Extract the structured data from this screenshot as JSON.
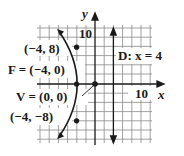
{
  "figure": {
    "type": "parabola-graph",
    "equation_hint": "y^2 = -16x",
    "axes": {
      "x_label": "x",
      "y_label": "y",
      "x_tick_label": "10",
      "y_tick_label": "10",
      "grid_step": 2,
      "x_range": [
        -12,
        12
      ],
      "y_range": [
        -12,
        12
      ]
    },
    "labels": {
      "point_top": "(−4, 8)",
      "focus": "F = (−4, 0)",
      "vertex": "V = (0, 0)",
      "point_bottom": "(−4, −8)",
      "directrix": "D: x = 4"
    },
    "points": [
      {
        "name": "point_top",
        "x": -4,
        "y": 8
      },
      {
        "name": "focus",
        "x": -4,
        "y": 0
      },
      {
        "name": "vertex",
        "x": 0,
        "y": 0
      },
      {
        "name": "point_bottom",
        "x": -4,
        "y": -8
      }
    ],
    "directrix_x": 4,
    "colors": {
      "ink": "#1a1a1a",
      "grid": "#8a8a8a",
      "background": "#ffffff"
    }
  }
}
